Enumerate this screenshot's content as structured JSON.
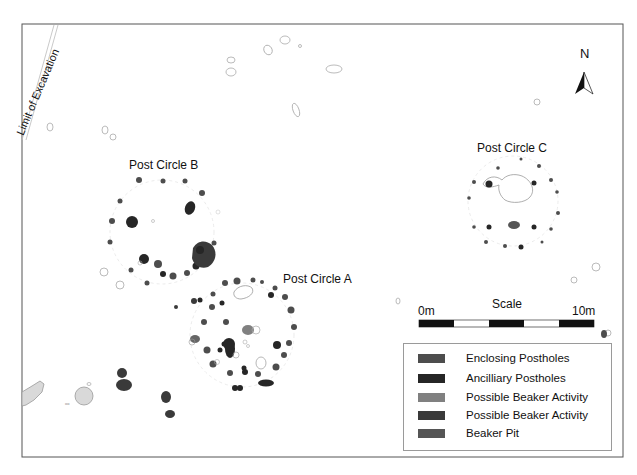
{
  "map": {
    "boundary_label": "Limit of Excavation",
    "circles": [
      {
        "name": "Post Circle A"
      },
      {
        "name": "Post Circle B"
      },
      {
        "name": "Post Circle C"
      }
    ]
  },
  "north_arrow": {
    "label": "N"
  },
  "scale_bar": {
    "title": "Scale",
    "start_label": "0m",
    "end_label": "10m",
    "segments": 5
  },
  "legend": {
    "items": [
      {
        "label": "Enclosing Postholes",
        "color": "#4d4d4d"
      },
      {
        "label": "Ancilliary Postholes",
        "color": "#262626"
      },
      {
        "label": "Possible Beaker Activity",
        "color": "#808080"
      },
      {
        "label": "Possible Beaker Activity",
        "color": "#3a3a3a"
      },
      {
        "label": "Beaker Pit",
        "color": "#555555"
      }
    ]
  },
  "colors": {
    "frame": "#555555",
    "enclosing": "#4d4d4d",
    "ancillary": "#262626",
    "activity_light": "#808080",
    "outline": "#aaaaaa",
    "natural_fill": "#d9d9d9"
  }
}
